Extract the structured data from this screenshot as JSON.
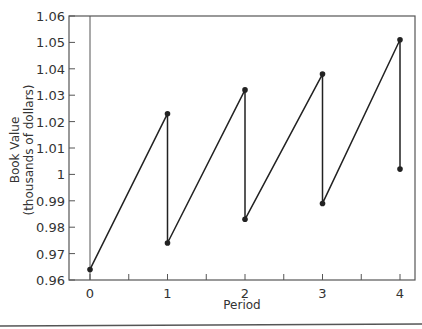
{
  "chart_data": {
    "type": "line",
    "title": "",
    "xlabel": "Period",
    "ylabel": "Book Value",
    "ylabel_sub": "(thousands of dollars)",
    "xlim": [
      0,
      4
    ],
    "ylim": [
      0.96,
      1.06
    ],
    "x_ticks": [
      0,
      0.5,
      1,
      1.5,
      2,
      2.5,
      3,
      3.5,
      4
    ],
    "x_tick_labels": [
      "0",
      "",
      "1",
      "",
      "2",
      "",
      "3",
      "",
      "4"
    ],
    "y_ticks": [
      0.96,
      0.97,
      0.98,
      0.99,
      1.0,
      1.01,
      1.02,
      1.03,
      1.04,
      1.05,
      1.06
    ],
    "y_tick_labels": [
      "0.96",
      "0.97",
      "0.98",
      "0.99",
      "1",
      "1.01",
      "1.02",
      "1.03",
      "1.04",
      "1.05",
      "1.06"
    ],
    "grid": false,
    "legend": null,
    "series": [
      {
        "name": "Book Value",
        "x": [
          0,
          1,
          1,
          2,
          2,
          3,
          3,
          4,
          4
        ],
        "values": [
          0.964,
          1.023,
          0.974,
          1.032,
          0.983,
          1.038,
          0.989,
          1.051,
          1.002
        ]
      }
    ]
  },
  "colors": {
    "line": "#222222",
    "axis": "#555555",
    "text": "#333333"
  }
}
